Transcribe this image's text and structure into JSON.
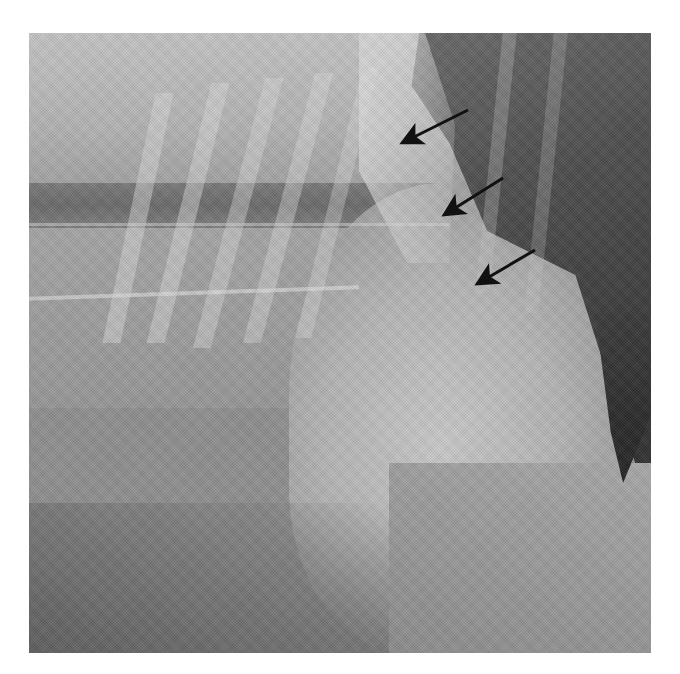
{
  "image": {
    "type": "radiograph",
    "description": "Lateral thoracic radiograph with three black arrows pointing to a margin",
    "frame": {
      "x": 29,
      "y": 33,
      "width": 622,
      "height": 620
    },
    "background_color": "#ffffff",
    "tones": {
      "base": "#8f8f8f",
      "light": "#c8c8c8",
      "bright": "#d9d9d9",
      "dark": "#4a4a4a",
      "darkest": "#2a2a2a",
      "band": "#6d6d6d"
    }
  },
  "annotations": {
    "arrow_color": "#111111",
    "arrows": [
      {
        "id": 1,
        "tail": [
          468,
          110
        ],
        "head": [
          398,
          145
        ]
      },
      {
        "id": 2,
        "tail": [
          503,
          178
        ],
        "head": [
          440,
          218
        ]
      },
      {
        "id": 3,
        "tail": [
          535,
          250
        ],
        "head": [
          473,
          286
        ]
      }
    ]
  }
}
